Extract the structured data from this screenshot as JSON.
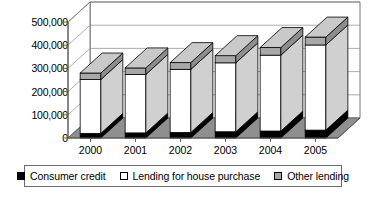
{
  "chart_data": {
    "type": "bar",
    "title": "",
    "xlabel": "",
    "ylabel": "",
    "stacked": true,
    "three_d": true,
    "grid": true,
    "legend_position": "bottom",
    "ylim": [
      0,
      500000
    ],
    "ytick_labels": [
      "500,000",
      "400,000",
      "300,000",
      "200,000",
      "100,000",
      "0"
    ],
    "ytick_values": [
      500000,
      400000,
      300000,
      200000,
      100000,
      0
    ],
    "categories": [
      "2000",
      "2001",
      "2002",
      "2003",
      "2004",
      "2005"
    ],
    "series": [
      {
        "name": "Consumer credit",
        "color": "#000000",
        "values": [
          20000,
          22000,
          24000,
          27000,
          30000,
          34000
        ]
      },
      {
        "name": "Lending for house purchase",
        "color": "#ffffff",
        "values": [
          232000,
          252000,
          272000,
          297000,
          327000,
          367000
        ]
      },
      {
        "name": "Other lending",
        "color": "#a8a8a8",
        "values": [
          28000,
          28000,
          29000,
          31000,
          33000,
          34000
        ]
      }
    ],
    "totals": [
      280000,
      302000,
      325000,
      355000,
      390000,
      435000
    ]
  },
  "legend": {
    "items": [
      {
        "label": "Consumer credit",
        "swatch": "black-square-icon"
      },
      {
        "label": "Lending for house purchase",
        "swatch": "white-square-icon"
      },
      {
        "label": "Other lending",
        "swatch": "gray-square-icon"
      }
    ]
  },
  "colors": {
    "consumer_credit": "#000000",
    "house_purchase": "#ffffff",
    "other_lending": "#a8a8a8",
    "floor": "#8f8f8f",
    "gridline": "#8a8a8a",
    "axis": "#555555",
    "wall": "#ffffff"
  }
}
